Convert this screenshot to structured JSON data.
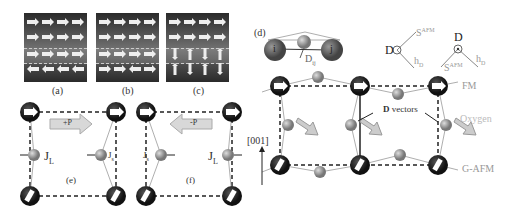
{
  "panels": {
    "a": {
      "label": "(a)",
      "rows": [
        [
          "right",
          "right",
          "right",
          "right"
        ],
        [
          "right",
          "right",
          "right",
          "right"
        ],
        [
          "right",
          "right",
          "right",
          "right"
        ],
        [
          "left",
          "left",
          "left",
          "left"
        ]
      ]
    },
    "b": {
      "label": "(b)",
      "rows": [
        [
          "right",
          "right",
          "right",
          "right"
        ],
        [
          "right",
          "right",
          "right",
          "right"
        ],
        [
          "right",
          "right",
          "right",
          "right"
        ],
        [
          "right",
          "right",
          "left",
          "right"
        ]
      ]
    },
    "c": {
      "label": "(c)",
      "rows": [
        [
          "right",
          "right",
          "right",
          "right"
        ],
        [
          "right",
          "right",
          "right",
          "right"
        ],
        [
          "down",
          "up",
          "down",
          "up"
        ],
        [
          "up",
          "down",
          "up",
          "down"
        ]
      ]
    },
    "d": {
      "label": "(d)",
      "atom_i": "i",
      "atom_j": "j",
      "dij": "D",
      "dij_sub": "ij",
      "legend1": {
        "d": "D",
        "s": "S",
        "s_sup": "AFM",
        "h": "h",
        "h_sub": "D"
      },
      "legend2": {
        "d": "D",
        "s": "S",
        "s_sup": "AFM",
        "h": "h",
        "h_sub": "D"
      },
      "fm_label": "FM",
      "gafm_label": "G-AFM",
      "oxygen_label": "Oxygen",
      "dvectors_bold": "D",
      "dvectors_text": " vectors",
      "axis_label": "[001]",
      "hd_arrow": "h"
    },
    "e": {
      "label": "(e)",
      "polarization": "+P",
      "j_long": "J",
      "j_long_sub": "L",
      "j_short": "J",
      "j_short_sub": "s"
    },
    "f": {
      "label": "(f)",
      "polarization": "-P",
      "j_long": "J",
      "j_long_sub": "L",
      "j_short": "J",
      "j_short_sub": "s"
    }
  },
  "colors": {
    "mn_atom": "#1e1e1e",
    "oxygen_atom": "#9a9a9a",
    "arrow_fill": "#d8d8d8",
    "label_gray": "#a0a0a0"
  }
}
